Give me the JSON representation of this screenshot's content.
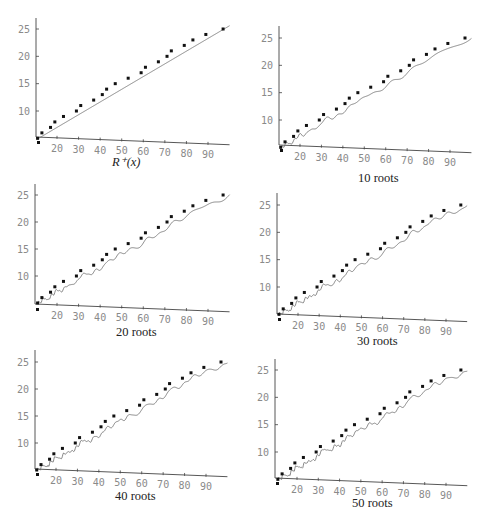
{
  "chart_data": [
    {
      "type": "line",
      "title": "",
      "caption": "R*(x)",
      "xlabel": "",
      "ylabel": "",
      "xlim": [
        10,
        100
      ],
      "ylim": [
        4,
        27
      ],
      "xticks": [
        20,
        30,
        40,
        50,
        60,
        70,
        80,
        90
      ],
      "yticks": [
        10,
        15,
        20,
        25
      ],
      "grid": false,
      "series": [
        {
          "name": "pi(x) at primes",
          "kind": "scatter",
          "x": [
            11,
            13,
            17,
            19,
            23,
            29,
            31,
            37,
            41,
            43,
            47,
            53,
            59,
            61,
            67,
            71,
            73,
            79,
            83,
            89,
            97
          ],
          "y": [
            5,
            6,
            7,
            8,
            9,
            10,
            11,
            12,
            13,
            14,
            15,
            16,
            17,
            18,
            19,
            20,
            21,
            22,
            23,
            24,
            25
          ]
        },
        {
          "name": "R*(x)",
          "kind": "line",
          "roots": 0
        }
      ]
    },
    {
      "type": "line",
      "caption": "10 roots",
      "xlim": [
        10,
        100
      ],
      "ylim": [
        4,
        27
      ],
      "xticks": [
        20,
        30,
        40,
        50,
        60,
        70,
        80,
        90
      ],
      "yticks": [
        10,
        15,
        20,
        25
      ],
      "grid": false,
      "series": [
        {
          "name": "pi(x) at primes",
          "kind": "scatter",
          "x": [
            11,
            13,
            17,
            19,
            23,
            29,
            31,
            37,
            41,
            43,
            47,
            53,
            59,
            61,
            67,
            71,
            73,
            79,
            83,
            89,
            97
          ],
          "y": [
            5,
            6,
            7,
            8,
            9,
            10,
            11,
            12,
            13,
            14,
            15,
            16,
            17,
            18,
            19,
            20,
            21,
            22,
            23,
            24,
            25
          ]
        },
        {
          "name": "approximation with 10 roots",
          "kind": "line",
          "roots": 10
        }
      ]
    },
    {
      "type": "line",
      "caption": "20 roots",
      "xlim": [
        10,
        100
      ],
      "ylim": [
        4,
        27
      ],
      "xticks": [
        20,
        30,
        40,
        50,
        60,
        70,
        80,
        90
      ],
      "yticks": [
        10,
        15,
        20,
        25
      ],
      "grid": false,
      "series": [
        {
          "name": "pi(x) at primes",
          "kind": "scatter",
          "x": [
            11,
            13,
            17,
            19,
            23,
            29,
            31,
            37,
            41,
            43,
            47,
            53,
            59,
            61,
            67,
            71,
            73,
            79,
            83,
            89,
            97
          ],
          "y": [
            5,
            6,
            7,
            8,
            9,
            10,
            11,
            12,
            13,
            14,
            15,
            16,
            17,
            18,
            19,
            20,
            21,
            22,
            23,
            24,
            25
          ]
        },
        {
          "name": "approximation with 20 roots",
          "kind": "line",
          "roots": 20
        }
      ]
    },
    {
      "type": "line",
      "caption": "30 roots",
      "xlim": [
        10,
        100
      ],
      "ylim": [
        4,
        27
      ],
      "xticks": [
        20,
        30,
        40,
        50,
        60,
        70,
        80,
        90
      ],
      "yticks": [
        10,
        15,
        20,
        25
      ],
      "grid": false,
      "series": [
        {
          "name": "pi(x) at primes",
          "kind": "scatter",
          "x": [
            11,
            13,
            17,
            19,
            23,
            29,
            31,
            37,
            41,
            43,
            47,
            53,
            59,
            61,
            67,
            71,
            73,
            79,
            83,
            89,
            97
          ],
          "y": [
            5,
            6,
            7,
            8,
            9,
            10,
            11,
            12,
            13,
            14,
            15,
            16,
            17,
            18,
            19,
            20,
            21,
            22,
            23,
            24,
            25
          ]
        },
        {
          "name": "approximation with 30 roots",
          "kind": "line",
          "roots": 30
        }
      ]
    },
    {
      "type": "line",
      "caption": "40 roots",
      "xlim": [
        10,
        100
      ],
      "ylim": [
        4,
        27
      ],
      "xticks": [
        20,
        30,
        40,
        50,
        60,
        70,
        80,
        90
      ],
      "yticks": [
        10,
        15,
        20,
        25
      ],
      "grid": false,
      "series": [
        {
          "name": "pi(x) at primes",
          "kind": "scatter",
          "x": [
            11,
            13,
            17,
            19,
            23,
            29,
            31,
            37,
            41,
            43,
            47,
            53,
            59,
            61,
            67,
            71,
            73,
            79,
            83,
            89,
            97
          ],
          "y": [
            5,
            6,
            7,
            8,
            9,
            10,
            11,
            12,
            13,
            14,
            15,
            16,
            17,
            18,
            19,
            20,
            21,
            22,
            23,
            24,
            25
          ]
        },
        {
          "name": "approximation with 40 roots",
          "kind": "line",
          "roots": 40
        }
      ]
    },
    {
      "type": "line",
      "caption": "50 roots",
      "xlim": [
        10,
        100
      ],
      "ylim": [
        4,
        27
      ],
      "xticks": [
        20,
        30,
        40,
        50,
        60,
        70,
        80,
        90
      ],
      "yticks": [
        10,
        15,
        20,
        25
      ],
      "grid": false,
      "series": [
        {
          "name": "pi(x) at primes",
          "kind": "scatter",
          "x": [
            11,
            13,
            17,
            19,
            23,
            29,
            31,
            37,
            41,
            43,
            47,
            53,
            59,
            61,
            67,
            71,
            73,
            79,
            83,
            89,
            97
          ],
          "y": [
            5,
            6,
            7,
            8,
            9,
            10,
            11,
            12,
            13,
            14,
            15,
            16,
            17,
            18,
            19,
            20,
            21,
            22,
            23,
            24,
            25
          ]
        },
        {
          "name": "approximation with 50 roots",
          "kind": "line",
          "roots": 50
        }
      ]
    }
  ],
  "panels": [
    {
      "caption": "R⁺(x)",
      "caption_italic": true
    },
    {
      "caption": "10 roots"
    },
    {
      "caption": "20 roots"
    },
    {
      "caption": "30 roots"
    },
    {
      "caption": "40 roots"
    },
    {
      "caption": "50 roots"
    }
  ],
  "colors": {
    "axis": "#444444",
    "curve": "#6a6a6a",
    "dot": "#111111",
    "tick_label": "#8a8a8a"
  }
}
